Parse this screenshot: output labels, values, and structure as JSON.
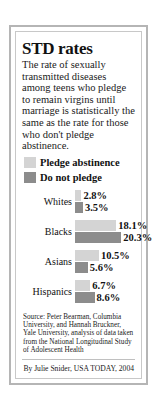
{
  "title": "STD rates",
  "deck": "The rate of sexually transmitted diseases among teens who pledge to remain virgins until marriage is statistically the same as the rate for those who don't pledge abstinence.",
  "legend": [
    {
      "label": "Pledge abstinence",
      "color": "#d4d4d4",
      "swatch": "light"
    },
    {
      "label": "Do not pledge",
      "color": "#8c8c8c",
      "swatch": "dark"
    }
  ],
  "source": "Source: Peter Bearman, Columbia University, and Hannah Bruckner, Yale University, analysis of data taken from the National Longitudinal Study of Adolescent Health",
  "byline": "By Julie Snider, USA TODAY, 2004",
  "chart_data": {
    "type": "bar",
    "orientation": "horizontal",
    "title": "STD rates",
    "xlabel": "",
    "ylabel": "",
    "categories": [
      "Whites",
      "Blacks",
      "Asians",
      "Hispanics"
    ],
    "series": [
      {
        "name": "Pledge abstinence",
        "color": "#d4d4d4",
        "values": [
          2.8,
          18.1,
          10.5,
          6.7
        ]
      },
      {
        "name": "Do not pledge",
        "color": "#8c8c8c",
        "values": [
          3.5,
          20.3,
          5.6,
          8.6
        ]
      }
    ],
    "value_labels": [
      [
        "2.8%",
        "3.5%"
      ],
      [
        "18.1%",
        "20.3%"
      ],
      [
        "10.5%",
        "5.6%"
      ],
      [
        "6.7%",
        "8.6%"
      ]
    ],
    "xlim": [
      0,
      21
    ],
    "grid": false,
    "legend_position": "top"
  }
}
